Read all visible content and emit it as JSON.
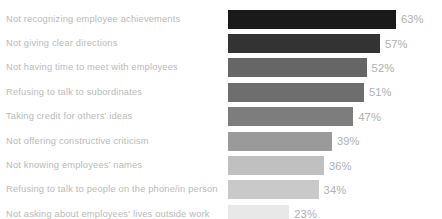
{
  "chart_data": {
    "type": "bar",
    "orientation": "horizontal",
    "title": "",
    "subtitle": "",
    "xlabel": "",
    "ylabel": "",
    "xlim": [
      0,
      63
    ],
    "grid": false,
    "legend": null,
    "value_suffix": "%",
    "categories": [
      "Not recognizing employee achievements",
      "Not giving clear directions",
      "Not having time to meet with employees",
      "Refusing to talk to subordinates",
      "Taking credit for others' ideas",
      "Not offering constructive criticism",
      "Not knowing employees' names",
      "Refusing to talk to people on the phone/in person",
      "Not asking about employees' lives outside work"
    ],
    "values": [
      63,
      57,
      52,
      51,
      47,
      39,
      36,
      34,
      23
    ],
    "value_labels": [
      "63%",
      "57%",
      "52%",
      "51%",
      "47%",
      "39%",
      "36%",
      "34%",
      "23%"
    ],
    "bar_colors": [
      "#1a1a1a",
      "#333333",
      "#666666",
      "#6e6e6e",
      "#7d7d7d",
      "#9a9a9a",
      "#c0c0c0",
      "#c9c9c9",
      "#e8e8e8"
    ],
    "rows": [
      {
        "label": "Not recognizing employee achievements",
        "value": 63,
        "value_label": "63%",
        "color": "#1a1a1a"
      },
      {
        "label": "Not giving clear directions",
        "value": 57,
        "value_label": "57%",
        "color": "#333333"
      },
      {
        "label": "Not having time to meet with employees",
        "value": 52,
        "value_label": "52%",
        "color": "#666666"
      },
      {
        "label": "Refusing to talk to subordinates",
        "value": 51,
        "value_label": "51%",
        "color": "#6e6e6e"
      },
      {
        "label": "Taking credit for others' ideas",
        "value": 47,
        "value_label": "47%",
        "color": "#7d7d7d"
      },
      {
        "label": "Not offering constructive criticism",
        "value": 39,
        "value_label": "39%",
        "color": "#9a9a9a"
      },
      {
        "label": "Not knowing employees' names",
        "value": 36,
        "value_label": "36%",
        "color": "#c0c0c0"
      },
      {
        "label": "Refusing to talk to people on the phone/in person",
        "value": 34,
        "value_label": "34%",
        "color": "#c9c9c9"
      },
      {
        "label": "Not asking about employees' lives outside work",
        "value": 23,
        "value_label": "23%",
        "color": "#e8e8e8"
      }
    ],
    "px_per_unit": 2.665,
    "label_color": "#b9b9b9",
    "value_color": "#b0b0b0",
    "background": "#ffffff"
  }
}
